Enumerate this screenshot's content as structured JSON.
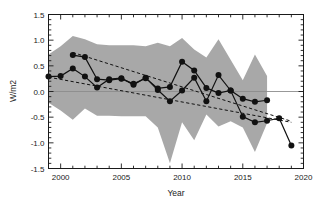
{
  "chart_data": {
    "type": "line",
    "title": "",
    "xlabel": "Year",
    "ylabel": "W/m2",
    "xlim": [
      1999,
      2020
    ],
    "ylim": [
      -1.5,
      1.5
    ],
    "xticks": [
      2000,
      2005,
      2010,
      2015,
      2020
    ],
    "xtick_labels": [
      "2000",
      "2005",
      "2010",
      "2015",
      "2020"
    ],
    "yticks": [
      -1.5,
      -1.0,
      -0.5,
      0.0,
      0.5,
      1.0,
      1.5
    ],
    "ytick_labels": [
      "-1.5",
      "-1.0",
      "-0.5",
      "0.0",
      "0.5",
      "1.0",
      "1.5"
    ],
    "grid": false,
    "legend_position": "none",
    "zero_line": 0.0,
    "colors": {
      "band": "#a8a8a8",
      "line": "#111111",
      "marker": "#111111",
      "trend": "#111111",
      "axis": "#1a1a1a",
      "zero_line": "#8c8c8c"
    },
    "series": [
      {
        "name": "Series A (long record)",
        "style": "solid-with-circle-markers",
        "x": [
          1999,
          2000,
          2001,
          2002,
          2003,
          2004,
          2005,
          2006,
          2007,
          2008,
          2009,
          2010,
          2011,
          2012,
          2013,
          2014,
          2015,
          2016,
          2017,
          2018,
          2019
        ],
        "values": [
          0.29,
          0.3,
          0.45,
          0.29,
          0.08,
          0.24,
          0.26,
          0.13,
          0.27,
          0.03,
          -0.19,
          0.02,
          0.27,
          -0.19,
          0.32,
          0.02,
          -0.49,
          -0.6,
          -0.57,
          -0.52,
          -1.05
        ]
      },
      {
        "name": "Series B (short record)",
        "style": "solid-with-circle-markers",
        "x": [
          2001,
          2002,
          2003,
          2004,
          2005,
          2006,
          2007,
          2008,
          2009,
          2010,
          2011,
          2012,
          2013,
          2014,
          2015,
          2016,
          2017
        ],
        "values": [
          0.71,
          0.67,
          0.24,
          0.22,
          0.25,
          0.15,
          0.26,
          0.06,
          0.09,
          0.58,
          0.41,
          0.07,
          -0.03,
          0.02,
          -0.14,
          -0.2,
          -0.17
        ]
      }
    ],
    "trend_lines": [
      {
        "name": "Trend A",
        "style": "dashed",
        "x": [
          1999,
          2019
        ],
        "values": [
          0.28,
          -0.6
        ]
      },
      {
        "name": "Trend B",
        "style": "dashed",
        "x": [
          2001,
          2019
        ],
        "values": [
          0.76,
          -0.58
        ]
      }
    ],
    "uncertainty_band": {
      "name": "Uncertainty envelope",
      "style": "filled-grey",
      "x": [
        1999,
        2000,
        2001,
        2002,
        2003,
        2004,
        2005,
        2006,
        2007,
        2008,
        2009,
        2010,
        2011,
        2012,
        2013,
        2014,
        2015,
        2016,
        2017
      ],
      "upper": [
        0.72,
        0.88,
        1.08,
        1.02,
        0.92,
        0.9,
        0.9,
        0.9,
        0.88,
        0.95,
        0.88,
        1.04,
        0.82,
        0.66,
        1.02,
        0.62,
        0.22,
        0.72,
        0.3
      ],
      "lower": [
        -0.22,
        -0.37,
        -0.55,
        -0.33,
        -0.47,
        -0.47,
        -0.48,
        -0.48,
        -0.48,
        -0.7,
        -1.4,
        -0.6,
        -0.95,
        -0.45,
        -0.68,
        -0.58,
        -0.7,
        -1.18,
        -0.62
      ]
    }
  }
}
